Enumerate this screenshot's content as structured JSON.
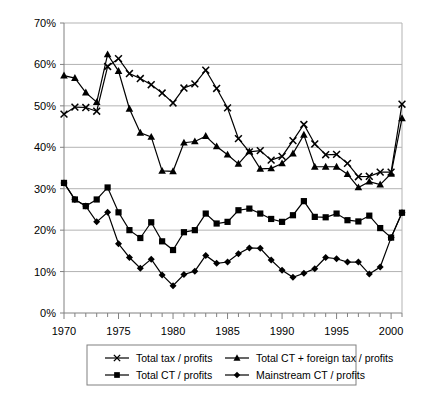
{
  "chart_data": {
    "type": "line",
    "title": "",
    "subtitle": "",
    "xlabel": "",
    "ylabel": "",
    "xlim": [
      1970,
      2001
    ],
    "ylim": [
      0,
      70
    ],
    "grid": true,
    "grid_axis": "y",
    "legend_position": "bottom",
    "y_tick_labels": [
      "0%",
      "10%",
      "20%",
      "30%",
      "40%",
      "50%",
      "60%",
      "70%"
    ],
    "y_ticks": [
      0,
      10,
      20,
      30,
      40,
      50,
      60,
      70
    ],
    "x_tick_labels": [
      "1970",
      "1975",
      "1980",
      "1985",
      "1990",
      "1995",
      "2000"
    ],
    "x_ticks": [
      1970,
      1975,
      1980,
      1985,
      1990,
      1995,
      2000
    ],
    "x_minor_ticks_every": 1,
    "x": [
      1970,
      1971,
      1972,
      1973,
      1974,
      1975,
      1976,
      1977,
      1978,
      1979,
      1980,
      1981,
      1982,
      1983,
      1984,
      1985,
      1986,
      1987,
      1988,
      1989,
      1990,
      1991,
      1992,
      1993,
      1994,
      1995,
      1996,
      1997,
      1998,
      1999,
      2000,
      2001
    ],
    "series": [
      {
        "name": "Total tax / profits",
        "marker": "x",
        "color": "#000000",
        "values": [
          48.0,
          49.7,
          49.6,
          48.7,
          59.5,
          61.4,
          57.8,
          56.6,
          55.1,
          53.1,
          50.7,
          54.3,
          55.3,
          58.6,
          54.2,
          49.5,
          42.1,
          38.9,
          39.2,
          36.9,
          37.8,
          41.6,
          45.5,
          40.8,
          38.2,
          38.3,
          36.1,
          32.9,
          33.0,
          34.0,
          34.0,
          50.4
        ]
      },
      {
        "name": "Total CT + foreign tax / profits",
        "marker": "triangle",
        "color": "#000000",
        "values": [
          57.3,
          56.7,
          53.2,
          50.9,
          62.4,
          58.4,
          49.3,
          43.5,
          42.5,
          34.3,
          34.2,
          41.1,
          41.4,
          42.7,
          40.2,
          38.2,
          36.0,
          39.0,
          34.8,
          34.9,
          36.1,
          38.5,
          43.0,
          35.3,
          35.3,
          35.3,
          33.5,
          30.3,
          31.7,
          31.0,
          33.6,
          47.0
        ]
      },
      {
        "name": "Total CT / profits",
        "marker": "square",
        "color": "#000000",
        "values": [
          31.4,
          27.4,
          25.8,
          27.4,
          30.3,
          24.3,
          20.0,
          18.1,
          21.9,
          17.3,
          15.2,
          19.5,
          20.0,
          24.0,
          21.6,
          22.0,
          24.8,
          25.2,
          24.0,
          22.7,
          22.0,
          23.6,
          27.0,
          23.2,
          23.1,
          24.0,
          22.4,
          22.1,
          23.5,
          20.5,
          18.2,
          24.2
        ]
      },
      {
        "name": "Mainstream CT / profits",
        "marker": "diamond",
        "color": "#000000",
        "values": [
          31.4,
          27.4,
          25.8,
          22.0,
          24.3,
          16.7,
          13.4,
          10.8,
          13.0,
          9.2,
          6.6,
          9.3,
          10.1,
          13.9,
          12.0,
          12.3,
          14.3,
          15.7,
          15.6,
          12.8,
          10.3,
          8.6,
          9.6,
          10.7,
          13.4,
          13.1,
          12.3,
          12.3,
          9.4,
          11.1,
          18.2,
          24.2
        ]
      }
    ]
  },
  "legend": {
    "entries": [
      {
        "label": "Total tax / profits",
        "marker": "x-marker"
      },
      {
        "label": "Total CT + foreign tax / profits",
        "marker": "triangle-marker"
      },
      {
        "label": "Total CT / profits",
        "marker": "square-marker"
      },
      {
        "label": "Mainstream CT / profits",
        "marker": "diamond-marker"
      }
    ]
  },
  "colors": {
    "ink": "#000000",
    "gridline": "#b3b3b3",
    "axis": "#808080",
    "background": "#ffffff",
    "legend_border": "#808080"
  }
}
